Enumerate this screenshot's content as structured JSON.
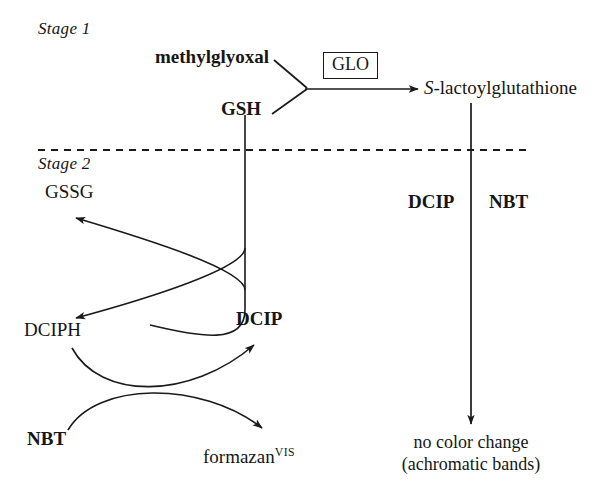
{
  "figure": {
    "type": "biochemical-pathway-diagram",
    "background_color": "#ffffff",
    "line_color": "#1a1a1a",
    "divider": {
      "style": "dashed",
      "label_above": "Stage 1",
      "label_below": "Stage 2"
    }
  },
  "stage1": {
    "title": "Stage 1",
    "substrate_1": "methylglyoxal",
    "substrate_2": "GSH",
    "enzyme_box": "GLO",
    "product": {
      "prefix": "S",
      "rest": "-lactoylglutathione"
    }
  },
  "stage2": {
    "title": "Stage 2",
    "left_cycle": {
      "gssg": "GSSG",
      "dciph": "DCIPH",
      "dcip": "DCIP",
      "nbt": "NBT",
      "formazan": {
        "base": "formazan",
        "superscript": "VIS"
      }
    },
    "right_branch": {
      "reagent_left": "DCIP",
      "reagent_right": "NBT",
      "outcome_line1": "no color change",
      "outcome_line2": "(achromatic bands)"
    }
  }
}
